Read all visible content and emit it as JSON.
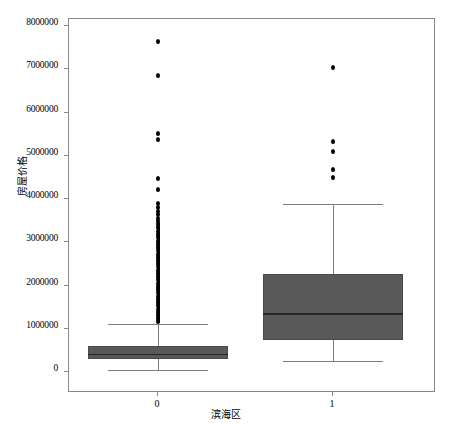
{
  "chart_data": {
    "type": "box",
    "title": "",
    "xlabel": "滨海区",
    "ylabel": "房屋价格",
    "ylim": [
      0,
      8000000
    ],
    "ytick_labels": [
      "0",
      "1000000",
      "2000000",
      "3000000",
      "4000000",
      "5000000",
      "6000000",
      "7000000",
      "8000000"
    ],
    "ytick_values": [
      0,
      1000000,
      2000000,
      3000000,
      4000000,
      5000000,
      6000000,
      7000000,
      8000000
    ],
    "xtick_labels": [
      "0",
      "1"
    ],
    "grid": false,
    "legend": null,
    "box_color": "#595959",
    "median_color": "#262626",
    "whisker_color": "#7d7d7d",
    "flier_color": "#000000",
    "categories": [
      {
        "label": "0",
        "whisker_low": 50000,
        "q1": 300000,
        "median": 420000,
        "q3": 610000,
        "whisker_high": 1120000,
        "fliers": [
          7650000,
          6850000,
          5520000,
          5370000,
          4480000,
          4220000,
          3900000,
          3800000,
          3720000,
          3640000,
          3560000,
          3480000,
          3400000,
          3330000,
          3250000,
          3180000,
          3100000,
          3020000,
          2950000,
          2880000,
          2800000,
          2720000,
          2650000,
          2580000,
          2500000,
          2430000,
          2350000,
          2280000,
          2200000,
          2130000,
          2050000,
          1980000,
          1900000,
          1830000,
          1750000,
          1680000,
          1600000,
          1530000,
          1450000,
          1380000,
          1300000,
          1230000,
          1160000
        ],
        "flier_dense_from": 1130000,
        "flier_dense_to": 3450000
      },
      {
        "label": "1",
        "whisker_low": 260000,
        "q1": 740000,
        "median": 1360000,
        "q3": 2270000,
        "whisker_high": 3880000,
        "fliers": [
          7050000,
          5320000,
          5100000,
          4680000,
          4500000
        ],
        "flier_dense_from": null,
        "flier_dense_to": null
      }
    ]
  },
  "axis_geometry": {
    "plot_left": 68,
    "plot_top": 18,
    "plot_width": 367,
    "plot_height": 374,
    "y_zero_px": 353,
    "y_per_unit_px": 4.156e-05,
    "cat_centers_px": [
      89,
      264
    ],
    "box_half_width_px": 70
  }
}
